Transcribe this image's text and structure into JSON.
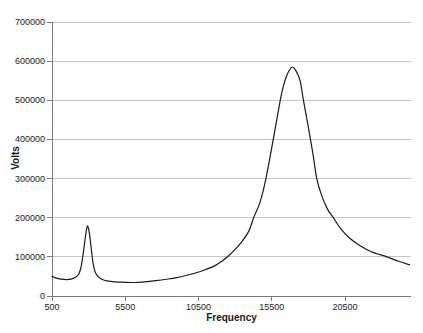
{
  "chart_data": {
    "type": "line",
    "title": "",
    "xlabel": "Frequency",
    "ylabel": "Volts",
    "xlim": [
      500,
      25000
    ],
    "ylim": [
      0,
      700000
    ],
    "x_ticks": [
      500,
      5500,
      10500,
      15500,
      20500
    ],
    "y_ticks": [
      0,
      100000,
      200000,
      300000,
      400000,
      500000,
      600000,
      700000
    ],
    "grid": "horizontal",
    "legend": "none",
    "colors": {
      "line": "#1a1a1a",
      "gridline": "#c4c4c4",
      "axis": "#7a7a7a",
      "tick_label": "#1a1a1a",
      "background": "#ffffff"
    },
    "peaks": [
      {
        "frequency": 2920,
        "volts": 179000
      },
      {
        "frequency": 16900,
        "volts": 585000
      }
    ],
    "series": [
      {
        "name": "Volts",
        "points": [
          [
            500,
            50000
          ],
          [
            800,
            45500
          ],
          [
            1100,
            43000
          ],
          [
            1500,
            41800
          ],
          [
            1800,
            43000
          ],
          [
            2100,
            48000
          ],
          [
            2310,
            55000
          ],
          [
            2450,
            69000
          ],
          [
            2540,
            86000
          ],
          [
            2630,
            108000
          ],
          [
            2720,
            134000
          ],
          [
            2810,
            159000
          ],
          [
            2920,
            179000
          ],
          [
            3040,
            163000
          ],
          [
            3130,
            137000
          ],
          [
            3220,
            108000
          ],
          [
            3310,
            82000
          ],
          [
            3450,
            61000
          ],
          [
            3630,
            50000
          ],
          [
            3900,
            43000
          ],
          [
            4240,
            38500
          ],
          [
            4800,
            36000
          ],
          [
            5480,
            35000
          ],
          [
            5900,
            34500
          ],
          [
            6400,
            35000
          ],
          [
            7000,
            36800
          ],
          [
            7600,
            39300
          ],
          [
            8300,
            42800
          ],
          [
            9000,
            47000
          ],
          [
            9700,
            53000
          ],
          [
            10400,
            60000
          ],
          [
            11000,
            68000
          ],
          [
            11600,
            77000
          ],
          [
            12100,
            89000
          ],
          [
            12500,
            101000
          ],
          [
            13000,
            119000
          ],
          [
            13500,
            141000
          ],
          [
            13950,
            167000
          ],
          [
            14260,
            200000
          ],
          [
            14700,
            240000
          ],
          [
            15100,
            300000
          ],
          [
            15600,
            400000
          ],
          [
            16075,
            500000
          ],
          [
            16300,
            538000
          ],
          [
            16550,
            566000
          ],
          [
            16750,
            580000
          ],
          [
            16900,
            585000
          ],
          [
            17050,
            581000
          ],
          [
            17250,
            568000
          ],
          [
            17450,
            547000
          ],
          [
            17660,
            500000
          ],
          [
            18000,
            430000
          ],
          [
            18300,
            365000
          ],
          [
            18570,
            300000
          ],
          [
            18900,
            257000
          ],
          [
            19300,
            222000
          ],
          [
            19700,
            200000
          ],
          [
            20200,
            172000
          ],
          [
            20800,
            148000
          ],
          [
            21500,
            129000
          ],
          [
            22300,
            113000
          ],
          [
            23350,
            100000
          ],
          [
            24200,
            88000
          ],
          [
            24900,
            80000
          ]
        ]
      }
    ]
  }
}
